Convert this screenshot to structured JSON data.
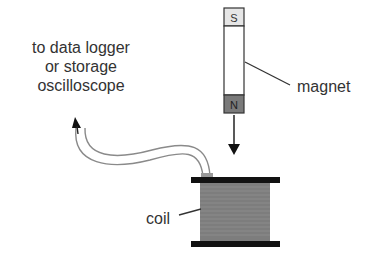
{
  "labels": {
    "destination_line1": "to data logger",
    "destination_line2": "or storage",
    "destination_line3": "oscilloscope",
    "magnet": "magnet",
    "coil": "coil",
    "pole_south": "S",
    "pole_north": "N"
  },
  "colors": {
    "text": "#333333",
    "south_pole": "#e6e6e6",
    "north_pole": "#7a7a7a",
    "coil_body": "#808080",
    "flange": "#111111",
    "wire": "#8a8a8a"
  }
}
